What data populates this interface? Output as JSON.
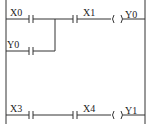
{
  "diagram": {
    "type": "ladder-logic",
    "rungs": [
      {
        "contacts": [
          {
            "label": "X0",
            "branch_parallel": "Y0"
          },
          {
            "label": "X1"
          }
        ],
        "coil": {
          "label": "Y0"
        }
      },
      {
        "contacts": [
          {
            "label": "X3"
          },
          {
            "label": "X4"
          }
        ],
        "coil": {
          "label": "Y1"
        }
      }
    ],
    "labels": {
      "x0": "X0",
      "y0_branch": "Y0",
      "x1": "X1",
      "y0_coil": "Y0",
      "x3": "X3",
      "x4": "X4",
      "y1_coil": "Y1"
    }
  }
}
